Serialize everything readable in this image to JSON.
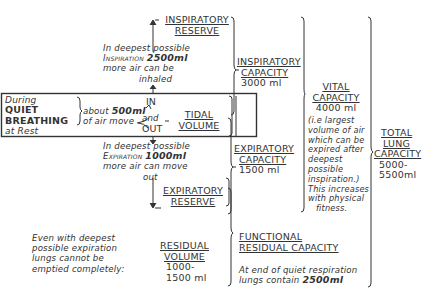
{
  "quiet_breathing_box": {
    "line1": "During",
    "line2": "QUIET",
    "line3": "BREATHING",
    "line4": "at Rest",
    "about": "about",
    "amount": "500ml",
    "air_move": "of air move",
    "in": "IN",
    "and": "and",
    "out": "OUT"
  },
  "tidal_volume": {
    "line1": "TIDAL",
    "line2": "VOLUME"
  },
  "inspiratory_reserve": {
    "title1": "INSPIRATORY",
    "title2": "RESERVE",
    "note1": "In deepest possible",
    "note2a": "Inspiration",
    "note2b": "2500ml",
    "note3": "more air can be",
    "note4": "inhaled"
  },
  "expiratory_reserve": {
    "title1": "EXPIRATORY",
    "title2": "RESERVE",
    "note1": "In deepest possible",
    "note2a": "Expiration",
    "note2b": "1000ml",
    "note3": "more air can move",
    "note4": "out"
  },
  "inspiratory_capacity": {
    "title1": "INSPIRATORY",
    "title2": "CAPACITY",
    "value": "3000 ml"
  },
  "expiratory_capacity": {
    "title1": "EXPIRATORY",
    "title2": "CAPACITY",
    "value": "1500 ml"
  },
  "vital_capacity": {
    "title1": "VITAL",
    "title2": "CAPACITY",
    "value": "4000 ml",
    "note": [
      "(i.e largest",
      "volume of air",
      "which can be",
      "expired after",
      "deepest",
      "possible",
      "inspiration.)",
      "This increases",
      "with physical",
      "fitness."
    ]
  },
  "total_lung_capacity": {
    "title1": "TOTAL",
    "title2": "LUNG",
    "title3": "CAPACITY",
    "value1": "5000-",
    "value2": "5500ml"
  },
  "residual_volume": {
    "note": [
      "Even with deepest",
      "possible expiration",
      "lungs cannot be",
      "emptied completely:"
    ],
    "title1": "RESIDUAL",
    "title2": "VOLUME",
    "value1": "1000-",
    "value2": "1500 ml"
  },
  "functional_residual_capacity": {
    "title1": "FUNCTIONAL",
    "title2": "RESIDUAL CAPACITY",
    "note1": "At end of quiet respiration",
    "note2a": "lungs contain",
    "note2b": "2500ml"
  }
}
